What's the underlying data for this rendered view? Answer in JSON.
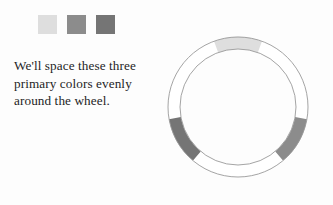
{
  "page": {
    "background_color": "#fdfdfd",
    "width": 333,
    "height": 205
  },
  "palette": {
    "title": "primary colors",
    "swatches": [
      {
        "name": "swatch-light",
        "color": "#dedede",
        "label": "light gray"
      },
      {
        "name": "swatch-medium",
        "color": "#8c8c8c",
        "label": "medium gray"
      },
      {
        "name": "swatch-dark",
        "color": "#757575",
        "label": "dark gray"
      }
    ]
  },
  "caption": {
    "full_text": "We'll space these three primary colors evenly around the wheel.",
    "lines": [
      "We'll space these three",
      "primary colors evenly",
      "around the wheel."
    ],
    "text_color": "#1d1d1f"
  },
  "wheel": {
    "center_x": 238,
    "center_y": 107,
    "outer_radius": 70,
    "inner_radius": 58,
    "stroke_color": "#9a9a9a",
    "stroke_width": 0.9,
    "band_fill": "#ffffff",
    "segment_span_degrees": 40,
    "segments": [
      {
        "name": "segment-top",
        "angle_degrees": 90,
        "color": "#dedede",
        "swatch_index": 0
      },
      {
        "name": "segment-bottom-left",
        "angle_degrees": 210,
        "color": "#757575",
        "swatch_index": 2
      },
      {
        "name": "segment-bottom-right",
        "angle_degrees": 330,
        "color": "#8c8c8c",
        "swatch_index": 1
      }
    ]
  },
  "chart_data": {
    "type": "pie",
    "categories": [
      "light gray",
      "dark gray",
      "medium gray"
    ],
    "values": [
      40,
      40,
      40
    ],
    "angles_degrees": [
      90,
      210,
      330
    ],
    "colors": [
      "#dedede",
      "#757575",
      "#8c8c8c"
    ],
    "xlabel": "",
    "ylabel": "",
    "legend": "none",
    "grid": false
  }
}
